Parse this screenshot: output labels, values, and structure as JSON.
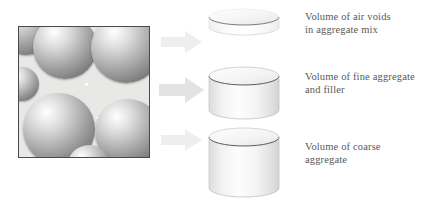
{
  "figure": {
    "width": 430,
    "height": 204,
    "background": "#ffffff"
  },
  "photo": {
    "name": "coarse-aggregate-micrograph",
    "description": "Cross-section of aggregate mix showing large spherical coarse aggregate particles surrounded by fine aggregate and filler",
    "border_color": "#4a4a4a",
    "matrix_color": "#e9e9e7",
    "sphere_count": 6
  },
  "arrows": [
    {
      "name": "arrow-to-air-voids",
      "target": "air-voids",
      "color": "#ededed"
    },
    {
      "name": "arrow-to-fine",
      "target": "fine-aggregate",
      "color": "#e4e4e4"
    },
    {
      "name": "arrow-to-coarse",
      "target": "coarse-aggregate",
      "color": "#ededed"
    }
  ],
  "cylinders": [
    {
      "name": "air-voids-segment",
      "label_key": "air",
      "fill": "#fafafa",
      "edge": "#555555"
    },
    {
      "name": "fine-aggregate-segment",
      "label_key": "fine",
      "fill": "#f2f2f2",
      "edge": "#555555"
    },
    {
      "name": "coarse-aggregate-segment",
      "label_key": "coarse",
      "fill": "#f4f4f4",
      "edge": "#555555"
    }
  ],
  "labels": {
    "air": "Volume of air voids\nin aggregate mix",
    "fine": "Volume of fine aggregate\nand filler",
    "coarse": "Volume of coarse\naggregate"
  },
  "colors": {
    "text": "#595959",
    "arrow": "#ededed",
    "cylinder_edge": "#555555",
    "photo_border": "#4a4a4a"
  }
}
